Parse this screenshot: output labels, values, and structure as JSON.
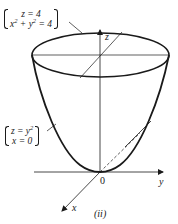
{
  "figure": {
    "caption": "(ii)",
    "surface": "paraboloid",
    "stroke_color": "#1a1a1a",
    "background": "#ffffff"
  },
  "axes": {
    "z_label": "z",
    "y_label": "y",
    "x_label": "x",
    "origin_label": "0"
  },
  "annotations": {
    "top_equation": {
      "line1": "z = 4",
      "line2_a": "x",
      "line2_b": "2",
      "line2_c": " + y",
      "line2_d": "2",
      "line2_e": " = 4"
    },
    "side_equation": {
      "line1_a": "z = y",
      "line1_b": "2",
      "line2": "x = 0"
    }
  }
}
